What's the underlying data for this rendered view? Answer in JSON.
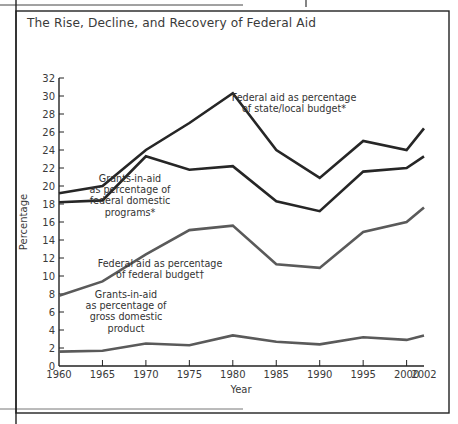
{
  "title": "The Rise, Decline, and Recovery of Federal Aid",
  "colors": {
    "dark_line": "#262626",
    "gray_line": "#5a5a5a",
    "frame": "#222222",
    "text": "#3a3a3a"
  },
  "chart_data": {
    "type": "line",
    "title": "The Rise, Decline, and Recovery of Federal Aid",
    "xlabel": "Year",
    "ylabel": "Percentage",
    "ylim": [
      0,
      32
    ],
    "grid": false,
    "legend_position": "inline annotations",
    "x": [
      1960,
      1965,
      1970,
      1975,
      1980,
      1985,
      1990,
      1995,
      2000,
      2002
    ],
    "x_tick_labels": [
      "1960",
      "1965",
      "1970",
      "1975",
      "1980",
      "1985",
      "1990",
      "1995",
      "2000",
      "2002"
    ],
    "y_tick_labels": [
      "0",
      "2",
      "4",
      "6",
      "8",
      "10",
      "12",
      "14",
      "16",
      "18",
      "20",
      "22",
      "24",
      "26",
      "28",
      "30",
      "32"
    ],
    "series": [
      {
        "name": "Federal aid as percentage of state/local budget*",
        "label_lines": [
          "Federal aid as percentage",
          "of state/local budget*"
        ],
        "style": "dark",
        "values": [
          19.2,
          20.0,
          24.0,
          27.0,
          30.3,
          24.0,
          20.9,
          25.0,
          24.0,
          26.4
        ]
      },
      {
        "name": "Grants-in-aid as percentage of federal domestic programs*",
        "label_lines": [
          "Grants-in-aid",
          "as percentage of",
          "federal domestic",
          "programs*"
        ],
        "style": "dark",
        "values": [
          18.2,
          18.4,
          23.3,
          21.8,
          22.2,
          18.3,
          17.2,
          21.6,
          22.0,
          23.3
        ]
      },
      {
        "name": "Federal aid as percentage of federal budget†",
        "label_lines": [
          "Federal aid as percentage",
          "of federal budget†"
        ],
        "style": "gray",
        "values": [
          7.8,
          9.4,
          12.4,
          15.1,
          15.6,
          11.3,
          10.9,
          14.9,
          16.0,
          17.6
        ]
      },
      {
        "name": "Grants-in-aid as percentage of gross domestic product",
        "label_lines": [
          "Grants-in-aid",
          "as percentage of",
          "gross domestic",
          "product"
        ],
        "style": "gray",
        "values": [
          1.6,
          1.7,
          2.5,
          2.3,
          3.4,
          2.7,
          2.4,
          3.2,
          2.9,
          3.4
        ]
      }
    ]
  }
}
